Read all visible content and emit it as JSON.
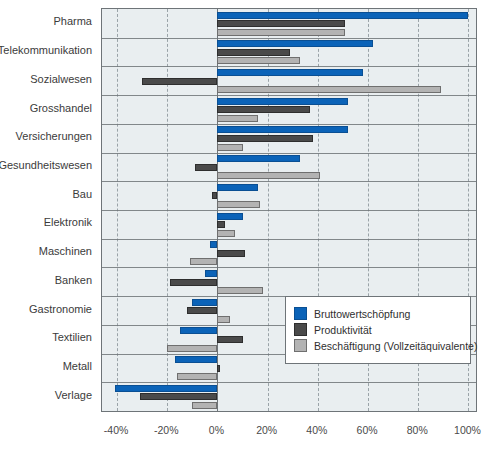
{
  "chart_data": {
    "type": "bar",
    "orientation": "horizontal",
    "title": "",
    "subtitle": "",
    "xlabel": "",
    "ylabel": "",
    "xlim": [
      -46,
      103
    ],
    "xticks": [
      -40,
      -20,
      0,
      20,
      40,
      60,
      80,
      100
    ],
    "xtick_labels": [
      "-40%",
      "-20%",
      "0%",
      "20%",
      "40%",
      "60%",
      "80%",
      "100%"
    ],
    "grid": true,
    "legend_position": "lower-right-inside",
    "categories": [
      "Pharma",
      "Telekommunikation",
      "Sozialwesen",
      "Grosshandel",
      "Versicherungen",
      "Gesundheitswesen",
      "Bau",
      "Elektronik",
      "Maschinen",
      "Banken",
      "Gastronomie",
      "Textilien",
      "Metall",
      "Verlage"
    ],
    "series": [
      {
        "name": "Bruttowertschöpfung",
        "color": "#0b63b8",
        "values": [
          100,
          62,
          58,
          52,
          52,
          33,
          16,
          10,
          -3,
          -5,
          -10,
          -15,
          -17,
          -41
        ]
      },
      {
        "name": "Produktivität",
        "color": "#4a4a4a",
        "values": [
          51,
          29,
          -30,
          37,
          38,
          -9,
          -2,
          3,
          11,
          -19,
          -12,
          10,
          1,
          -31
        ]
      },
      {
        "name": "Beschäftigung (Vollzeitäquivalente)",
        "color": "#b3b3b3",
        "values": [
          51,
          33,
          89,
          16,
          10,
          41,
          17,
          7,
          -11,
          18,
          5,
          -20,
          -16,
          -10
        ]
      }
    ]
  },
  "legend": {
    "items": [
      {
        "label": "Bruttowertschöpfung",
        "swatch": "legend-swatch-blue"
      },
      {
        "label": "Produktivität",
        "swatch": "legend-swatch-darkgray"
      },
      {
        "label": "Beschäftigung (Vollzeitäquivalente)",
        "swatch": "legend-swatch-lightgray"
      }
    ]
  },
  "colors": {
    "series_blue": "#0b63b8",
    "series_dark_gray": "#4a4a4a",
    "series_light_gray": "#b3b3b3",
    "plot_background": "#e9eef0",
    "axis_line": "#6e7478",
    "grid_line": "#9aa3a8"
  }
}
